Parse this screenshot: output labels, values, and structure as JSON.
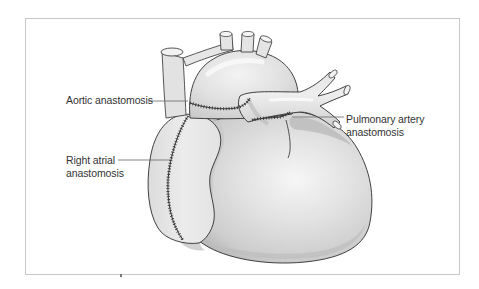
{
  "figure": {
    "type": "medical-illustration",
    "colors": {
      "frame_border": "#c8c8c8",
      "tissue_light": "#e9e9e9",
      "tissue_mid": "#d4d4d4",
      "tissue_shadow": "#b3b3b3",
      "outline": "#2e2e2e",
      "suture": "#333333",
      "label_text": "#333333",
      "leader_line": "#666666"
    }
  },
  "labels": {
    "aortic": {
      "line1": "Aortic anastomosis"
    },
    "right_atrial": {
      "line1": "Right atrial",
      "line2": "anastomosis"
    },
    "pulmonary": {
      "line1": "Pulmonary artery",
      "line2": "anastomosis"
    }
  }
}
